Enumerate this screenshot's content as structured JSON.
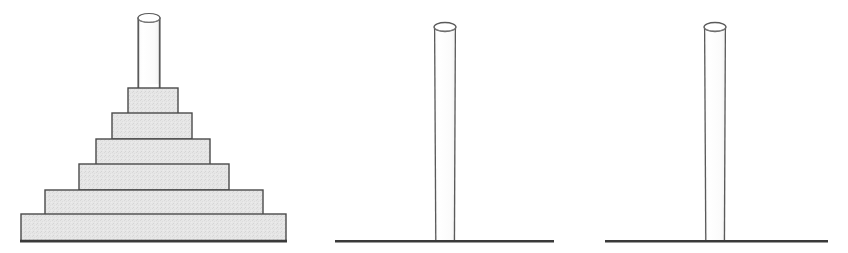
{
  "canvas": {
    "width": 848,
    "height": 253,
    "background": "#ffffff"
  },
  "style": {
    "step_fill": "#e4e4e4",
    "step_fill_alt": "#e9e9e9",
    "step_stroke": "#4a4a4a",
    "column_fill": "#ffffff",
    "column_stroke": "#5a5a5a",
    "ground_stroke": "#3a3a3a",
    "step_stroke_width": 1.4,
    "column_stroke_width": 1.2,
    "ground_stroke_width": 2.6
  },
  "figures": [
    {
      "id": "figure-stepped-pyramid",
      "name": "stepped-pyramid-with-column",
      "caption": "",
      "ground": {
        "x1": 20,
        "x2": 287,
        "y": 241
      },
      "column": {
        "x": 138,
        "width": 22,
        "top_y": 18,
        "bottom_y": 89,
        "ellipse_rx": 11,
        "ellipse_ry": 4.5
      },
      "steps": [
        {
          "index": 1,
          "x": 128,
          "y": 88,
          "width": 50,
          "height": 26
        },
        {
          "index": 2,
          "x": 112,
          "y": 113,
          "width": 80,
          "height": 26
        },
        {
          "index": 3,
          "x": 96,
          "y": 139,
          "width": 114,
          "height": 26
        },
        {
          "index": 4,
          "x": 79,
          "y": 164,
          "width": 150,
          "height": 26
        },
        {
          "index": 5,
          "x": 45,
          "y": 190,
          "width": 218,
          "height": 25
        },
        {
          "index": 6,
          "x": 21,
          "y": 214,
          "width": 265,
          "height": 27
        }
      ]
    },
    {
      "id": "figure-column-two",
      "name": "standalone-column-left",
      "caption": "",
      "ground": {
        "x1": 335,
        "x2": 554,
        "y": 241
      },
      "column": {
        "x": 434,
        "width": 22,
        "top_y": 27,
        "bottom_y": 241,
        "ellipse_rx": 11,
        "ellipse_ry": 4.5
      },
      "steps": []
    },
    {
      "id": "figure-column-three",
      "name": "standalone-column-right",
      "caption": "",
      "ground": {
        "x1": 605,
        "x2": 828,
        "y": 241
      },
      "column": {
        "x": 704,
        "width": 22,
        "top_y": 27,
        "bottom_y": 241,
        "ellipse_rx": 11,
        "ellipse_ry": 4.5
      },
      "steps": []
    }
  ],
  "chart_data": {
    "type": "diagram",
    "title": "",
    "panels": [
      {
        "label": "left",
        "shape": "stepped-pyramid",
        "step_count": 6,
        "step_widths": [
          50,
          80,
          114,
          150,
          218,
          265
        ],
        "step_heights": [
          26,
          26,
          26,
          26,
          25,
          27
        ],
        "column_height": 71,
        "column_width": 22
      },
      {
        "label": "middle",
        "shape": "column",
        "step_count": 0,
        "column_height": 214,
        "column_width": 22
      },
      {
        "label": "right",
        "shape": "column",
        "step_count": 0,
        "column_height": 214,
        "column_width": 22
      }
    ]
  }
}
